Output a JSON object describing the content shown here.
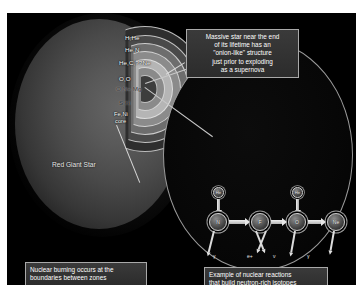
{
  "figure": {
    "background_color": "#000000",
    "border_color": "#ffffff"
  },
  "star_diagram": {
    "name": "onion-shell massive star cross-section",
    "star_label": "Red Giant Star",
    "shells": [
      {
        "label": "H,He",
        "color": "#2e2e2e"
      },
      {
        "label": "He,N",
        "color": "#4a4a4a"
      },
      {
        "label": "He,C,??Ne",
        "color": "#6d6d6d"
      },
      {
        "label": "O,O",
        "color": "#8b8b8b"
      },
      {
        "label": "O,Ne,Mg",
        "color": "#b5b5b5"
      },
      {
        "label": "S,Si",
        "color": "#8a8a8a"
      },
      {
        "label": "Fe,Ni",
        "color": "#3d3d3d"
      },
      {
        "label": "core",
        "color": "#3d3d3d"
      }
    ]
  },
  "callouts": {
    "top": {
      "line1": "Massive star near the end",
      "line2": "of its lifetime has an",
      "line3": "\"onion-like\" structure",
      "line4": "just prior to exploding",
      "line5": "as a supernova"
    },
    "bottom_left": {
      "line1": "Nuclear burning occurs at the",
      "line2": "boundaries between zones"
    },
    "bottom_right": {
      "line1": "Example of nuclear reactions",
      "line2": "that build neutron-rich isotopes"
    }
  },
  "reaction_chain": {
    "title": "nuclear reaction chain building neutron-rich isotopes",
    "captured_particles": [
      {
        "label": "He",
        "position": "above-node-1"
      },
      {
        "label": "He",
        "position": "above-node-3"
      }
    ],
    "nodes": [
      {
        "label": "N"
      },
      {
        "label": "F"
      },
      {
        "label": "O"
      },
      {
        "label": "Ne"
      }
    ],
    "emissions": [
      {
        "symbol": "γ",
        "from_node": 1
      },
      {
        "symbol": "e+",
        "from_node": 2
      },
      {
        "symbol": "ν",
        "from_node": 2
      },
      {
        "symbol": "γ",
        "from_node": 3
      }
    ]
  }
}
